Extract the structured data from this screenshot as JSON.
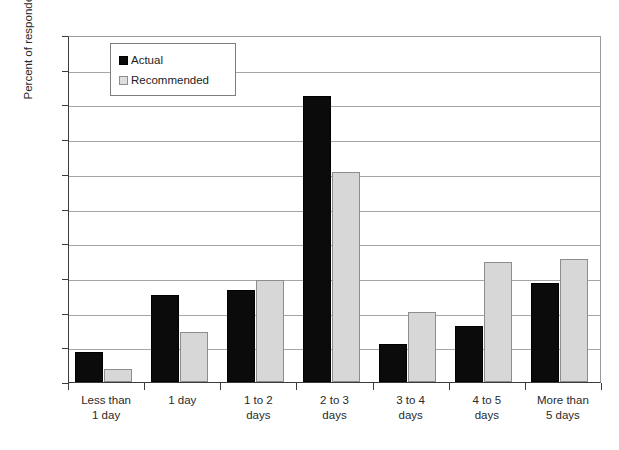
{
  "chart_data": {
    "type": "bar",
    "title": "",
    "subtitle": "",
    "xlabel": "",
    "ylabel": "Percent of respondents",
    "ylim": [
      0,
      50
    ],
    "ytick_step": 5,
    "ytick_labels": [
      "50%",
      "45%",
      "40%",
      "35%",
      "30%",
      "25%",
      "20%",
      "15%",
      "10%",
      "5%",
      "0%"
    ],
    "grid": "horizontal",
    "legend_position": "top-left-inside",
    "categories": [
      "Less than\n1 day",
      "1 day",
      "1 to 2\ndays",
      "2 to 3\ndays",
      "3 to 4\ndays",
      "4 to 5\ndays",
      "More than\n5 days"
    ],
    "series": [
      {
        "name": "Actual",
        "color": "#0b0b0b",
        "values": [
          4.3,
          12.6,
          13.3,
          41.2,
          5.5,
          8.1,
          14.2
        ]
      },
      {
        "name": "Recommended",
        "color": "#d7d7d7",
        "values": [
          1.9,
          7.2,
          14.7,
          30.3,
          10.1,
          17.3,
          17.7
        ]
      }
    ]
  },
  "legend": {
    "items": [
      {
        "label": "Actual",
        "swatch": "black-square-icon"
      },
      {
        "label": "Recommended",
        "swatch": "gray-square-icon"
      }
    ]
  }
}
